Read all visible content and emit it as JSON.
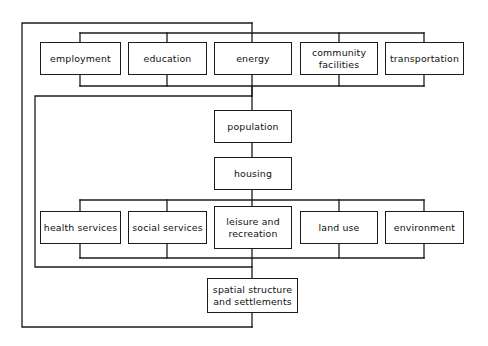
{
  "diagram": {
    "type": "hierarchy-block-diagram",
    "canvas": {
      "width": 488,
      "height": 346
    },
    "stroke_color": "#1b1b1b",
    "background_color": "#ffffff",
    "nodes": [
      {
        "id": "employment",
        "label": "employment",
        "x": 40,
        "y": 42,
        "w": 81,
        "h": 33
      },
      {
        "id": "education",
        "label": "education",
        "x": 128,
        "y": 42,
        "w": 79,
        "h": 33
      },
      {
        "id": "energy",
        "label": "energy",
        "x": 214,
        "y": 42,
        "w": 78,
        "h": 33
      },
      {
        "id": "community-facilities",
        "label": "community\nfacilities",
        "x": 300,
        "y": 42,
        "w": 78,
        "h": 33
      },
      {
        "id": "transportation",
        "label": "transportation",
        "x": 385,
        "y": 42,
        "w": 79,
        "h": 33
      },
      {
        "id": "population",
        "label": "population",
        "x": 214,
        "y": 110,
        "w": 78,
        "h": 33
      },
      {
        "id": "housing",
        "label": "housing",
        "x": 214,
        "y": 157,
        "w": 78,
        "h": 33
      },
      {
        "id": "health-services",
        "label": "health services",
        "x": 40,
        "y": 211,
        "w": 81,
        "h": 33
      },
      {
        "id": "social-services",
        "label": "social services",
        "x": 128,
        "y": 211,
        "w": 79,
        "h": 33
      },
      {
        "id": "leisure-recreation",
        "label": "leisure and\nrecreation",
        "x": 214,
        "y": 206,
        "w": 78,
        "h": 43
      },
      {
        "id": "land-use",
        "label": "land  use",
        "x": 300,
        "y": 211,
        "w": 78,
        "h": 33
      },
      {
        "id": "environment",
        "label": "environment",
        "x": 385,
        "y": 211,
        "w": 79,
        "h": 33
      },
      {
        "id": "spatial-structure",
        "label": "spatial structure\nand settlements",
        "x": 207,
        "y": 278,
        "w": 91,
        "h": 35
      }
    ]
  }
}
